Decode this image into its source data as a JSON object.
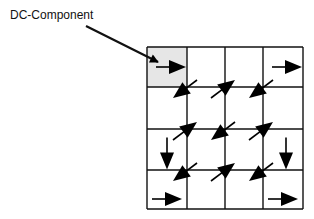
{
  "diagram": {
    "label": "DC-Component",
    "grid_rows": 4,
    "grid_cols": 4,
    "highlighted_cell": {
      "row": 0,
      "col": 0,
      "fill": "#e6e6e6"
    },
    "pointer_arrow": {
      "from": "label",
      "to": "highlighted_cell"
    },
    "vectors": [
      {
        "row": 0,
        "col": 0,
        "direction": "right"
      },
      {
        "row": 0,
        "col": 3,
        "direction": "right"
      },
      {
        "row": 1,
        "col": 0,
        "direction": "down-left",
        "at": "top-right-corner"
      },
      {
        "row": 1,
        "col": 1,
        "direction": "up-right",
        "at": "top-right-corner"
      },
      {
        "row": 1,
        "col": 2,
        "direction": "down-left",
        "at": "top-right-corner"
      },
      {
        "row": 2,
        "col": 0,
        "direction": "down"
      },
      {
        "row": 2,
        "col": 0,
        "direction": "up-right",
        "at": "top-right-corner"
      },
      {
        "row": 2,
        "col": 1,
        "direction": "down-left",
        "at": "top-right-corner"
      },
      {
        "row": 2,
        "col": 2,
        "direction": "up-right",
        "at": "top-right-corner"
      },
      {
        "row": 2,
        "col": 3,
        "direction": "down"
      },
      {
        "row": 3,
        "col": 0,
        "direction": "down-left",
        "at": "top-right-corner"
      },
      {
        "row": 3,
        "col": 1,
        "direction": "up-right",
        "at": "top-right-corner"
      },
      {
        "row": 3,
        "col": 2,
        "direction": "down-left",
        "at": "top-right-corner"
      },
      {
        "row": 3,
        "col": 0,
        "direction": "right",
        "at": "bottom"
      },
      {
        "row": 3,
        "col": 3,
        "direction": "right",
        "at": "bottom"
      }
    ],
    "colors": {
      "line": "#111111",
      "arrow": "#000000"
    }
  }
}
